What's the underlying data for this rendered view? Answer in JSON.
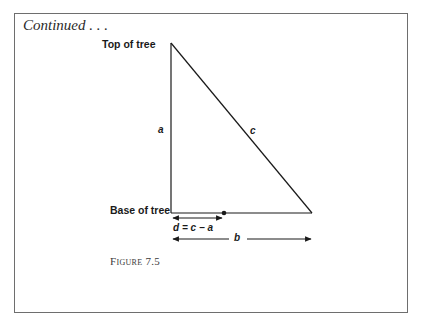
{
  "header": {
    "continued_label": "Continued . . ."
  },
  "diagram": {
    "top_label": "Top of tree",
    "base_label": "Base of tree",
    "side_a_label": "a",
    "hypotenuse_c_label": "c",
    "d_formula_label": "d = c − a",
    "b_label": "b",
    "line_color": "#1a1a1a"
  },
  "figure": {
    "caption": "Figure 7.5"
  }
}
